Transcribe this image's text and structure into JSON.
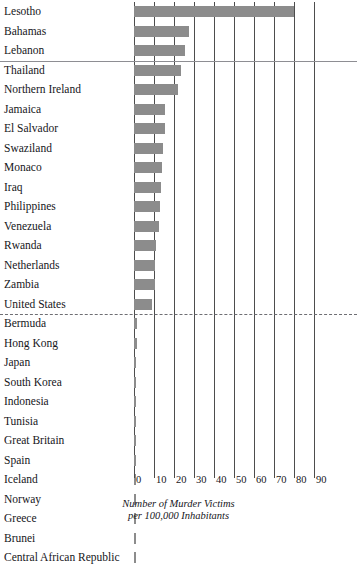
{
  "chart_data": {
    "type": "bar",
    "orientation": "horizontal",
    "title": "",
    "xlabel": "Number of Murder Victims per 100,000 Inhabitants",
    "ylabel": "",
    "xlim": [
      0,
      90
    ],
    "xticks": [
      0,
      10,
      20,
      30,
      40,
      50,
      60,
      70,
      80,
      90
    ],
    "xtick_labels": [
      "0",
      "10",
      "20",
      "30",
      "40",
      "50",
      "60",
      "70",
      "80",
      "90"
    ],
    "grid": true,
    "legend": "none",
    "bar_color": "#8c8c8c",
    "categories": [
      "Lesotho",
      "Bahamas",
      "Lebanon",
      "Thailand",
      "Northern Ireland",
      "Jamaica",
      "El Salvador",
      "Swaziland",
      "Monaco",
      "Iraq",
      "Philippines",
      "Venezuela",
      "Rwanda",
      "Netherlands",
      "Zambia",
      "United States",
      "Bermuda",
      "Hong Kong",
      "Japan",
      "South Korea",
      "Indonesia",
      "Tunisia",
      "Great Britain",
      "Spain",
      "Iceland",
      "Norway",
      "Greece",
      "Brunei",
      "Central African Republic"
    ],
    "values": [
      80.0,
      27.5,
      25.5,
      23.5,
      22.0,
      15.5,
      15.5,
      14.5,
      14.0,
      13.5,
      13.0,
      12.5,
      11.0,
      10.5,
      10.5,
      9.0,
      1.5,
      1.3,
      1.0,
      1.0,
      1.0,
      1.0,
      1.0,
      1.0,
      1.0,
      1.0,
      1.0,
      1.0,
      0.8
    ],
    "annotations": {
      "separator_solid_after_category": "Lebanon",
      "separator_dashed_after_category": "United States"
    },
    "caption": {
      "line1": "Number of Murder Victims",
      "line2": "per 100,000 Inhabitants"
    }
  }
}
